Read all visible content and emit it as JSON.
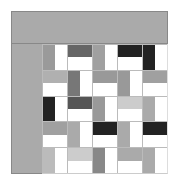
{
  "board": {
    "frame_color": "#aaaaaa",
    "rows": 5,
    "cols": 5,
    "cells": [
      [
        {
          "half": "left",
          "color": "#9a9a9a"
        },
        {
          "half": "top",
          "color": "#666666"
        },
        {
          "half": "left",
          "color": "#a0a0a0"
        },
        {
          "half": "top",
          "color": "#222222"
        },
        {
          "half": "left",
          "color": "#222222"
        }
      ],
      [
        {
          "half": "top",
          "color": "#b0b0b0"
        },
        {
          "half": "left",
          "color": "#777777"
        },
        {
          "half": "top",
          "color": "#999999"
        },
        {
          "half": "left",
          "color": "#999999"
        },
        {
          "half": "top",
          "color": "#a0a0a0"
        }
      ],
      [
        {
          "half": "left",
          "color": "#222222"
        },
        {
          "half": "top",
          "color": "#555555"
        },
        {
          "half": "left",
          "color": "#999999"
        },
        {
          "half": "top",
          "color": "#cccccc"
        },
        {
          "half": "left",
          "color": "#aaaaaa"
        }
      ],
      [
        {
          "half": "top",
          "color": "#a0a0a0"
        },
        {
          "half": "left",
          "color": "#aaaaaa"
        },
        {
          "half": "top",
          "color": "#222222"
        },
        {
          "half": "left",
          "color": "#aaaaaa"
        },
        {
          "half": "top",
          "color": "#222222"
        }
      ],
      [
        {
          "half": "left",
          "color": "#bbbbbb"
        },
        {
          "half": "top",
          "color": "#cccccc"
        },
        {
          "half": "left",
          "color": "#888888"
        },
        {
          "half": "top",
          "color": "#aaaaaa"
        },
        {
          "half": "left",
          "color": "#aaaaaa"
        }
      ]
    ]
  }
}
